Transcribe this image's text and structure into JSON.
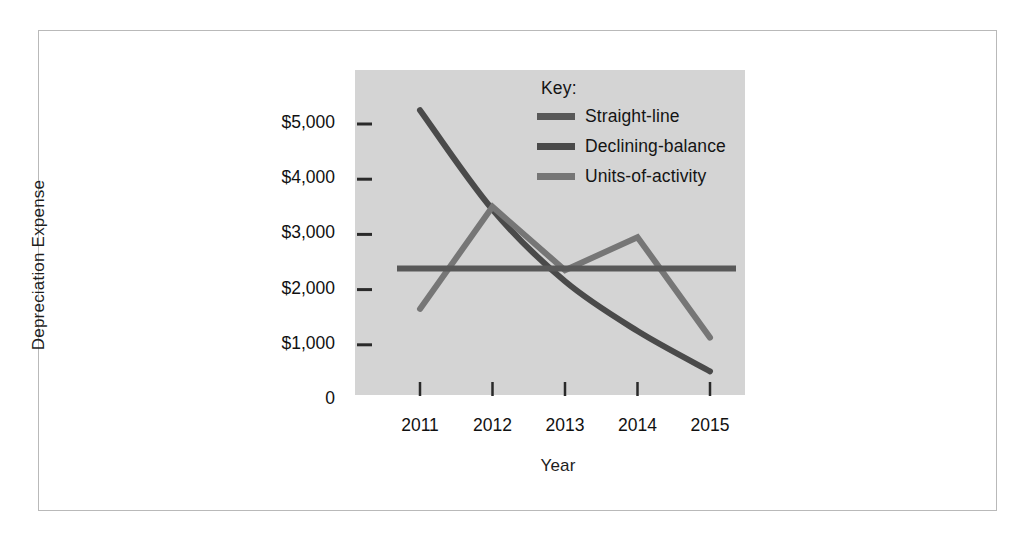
{
  "chart_data": {
    "type": "line",
    "title": "",
    "xlabel": "Year",
    "ylabel": "Depreciation Expense",
    "categories": [
      "2011",
      "2012",
      "2013",
      "2014",
      "2015"
    ],
    "x_tick_labels": [
      "2011",
      "2012",
      "2013",
      "2014",
      "2015"
    ],
    "y_tick_labels": [
      "$5,000",
      "$4,000",
      "$3,000",
      "$2,000",
      "$1,000",
      "0"
    ],
    "y_tick_values": [
      5000,
      4000,
      3000,
      2000,
      1000,
      0
    ],
    "ylim": [
      0,
      5800
    ],
    "grid": false,
    "legend_position": "inside-top-right",
    "legend_title": "Key:",
    "plot_background": "#d4d4d4",
    "series": [
      {
        "name": "Straight-line",
        "color": "#585858",
        "style": "flat",
        "values": [
          2380,
          2380,
          2380,
          2380,
          2380
        ]
      },
      {
        "name": "Declining-balance",
        "color": "#4a4a4a",
        "style": "curve",
        "values": [
          5250,
          3450,
          2150,
          1250,
          520
        ]
      },
      {
        "name": "Units-of-activity",
        "color": "#767676",
        "style": "zigzag",
        "values": [
          1650,
          3500,
          2350,
          2950,
          1130
        ]
      }
    ]
  },
  "legend": {
    "title": "Key:",
    "items": [
      {
        "label": "Straight-line",
        "color": "#585858"
      },
      {
        "label": "Declining-balance",
        "color": "#4a4a4a"
      },
      {
        "label": "Units-of-activity",
        "color": "#767676"
      }
    ]
  },
  "axes": {
    "x_title": "Year",
    "y_title": "Depreciation Expense"
  }
}
